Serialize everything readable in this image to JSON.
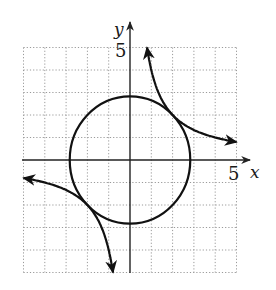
{
  "chart_data": {
    "type": "line",
    "title": "",
    "xlabel": "x",
    "ylabel": "y",
    "xlim": [
      -5,
      5
    ],
    "ylim": [
      -5,
      5
    ],
    "grid": true,
    "tick_labels": {
      "x": [
        "5"
      ],
      "y": [
        "5"
      ]
    },
    "series": [
      {
        "name": "circle",
        "equation": "x^2 + y^2 = 8",
        "center": [
          0,
          0
        ],
        "radius": 2.83
      },
      {
        "name": "hyperbola",
        "equation": "xy = 4",
        "branches": [
          {
            "x": [
              0.8,
              1,
              1.33,
              2,
              2.67,
              4,
              5
            ],
            "y": [
              5,
              4,
              3,
              2,
              1.5,
              1,
              0.8
            ],
            "arrows": "both"
          },
          {
            "x": [
              -5,
              -4,
              -2.67,
              -2,
              -1.33,
              -1,
              -0.8
            ],
            "y": [
              -0.8,
              -1,
              -1.5,
              -2,
              -3,
              -4,
              -5
            ],
            "arrows": "both"
          }
        ]
      }
    ],
    "tangent_points": [
      [
        2,
        2
      ],
      [
        -2,
        -2
      ]
    ]
  },
  "labels": {
    "x_axis": "x",
    "y_axis": "y",
    "x_tick": "5",
    "y_tick": "5"
  },
  "colors": {
    "curve": "#111111",
    "axis": "#222222",
    "grid": "#9a9a9a"
  }
}
